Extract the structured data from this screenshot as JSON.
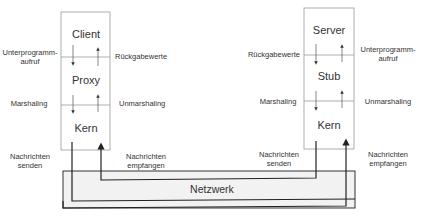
{
  "diagram": {
    "type": "rpc-architecture",
    "client_stack": {
      "layers": [
        "Client",
        "Proxy",
        "Kern"
      ],
      "left_labels": {
        "call": [
          "Unterprogramm-",
          "aufruf"
        ],
        "marshal": "Marshaling",
        "send": [
          "Nachrichten",
          "senden"
        ]
      },
      "right_labels": {
        "return": "Rückgabewerte",
        "unmarshal": "Unmarshaling",
        "receive": [
          "Nachrichten",
          "empfangen"
        ]
      }
    },
    "server_stack": {
      "layers": [
        "Server",
        "Stub",
        "Kern"
      ],
      "left_labels": {
        "return": "Rückgabewerte",
        "marshal": "Marshaling",
        "send": [
          "Nachrichten",
          "senden"
        ]
      },
      "right_labels": {
        "call": [
          "Unterprogramm-",
          "aufruf"
        ],
        "unmarshal": "Unmarshaling",
        "receive": [
          "Nachrichten",
          "empfangen"
        ]
      }
    },
    "network": {
      "label": "Netzwerk"
    },
    "colors": {
      "stroke": "#222222",
      "box_stroke": "#9a9a9a",
      "network_fill": "#f2f2f2",
      "text": "#333333"
    }
  }
}
